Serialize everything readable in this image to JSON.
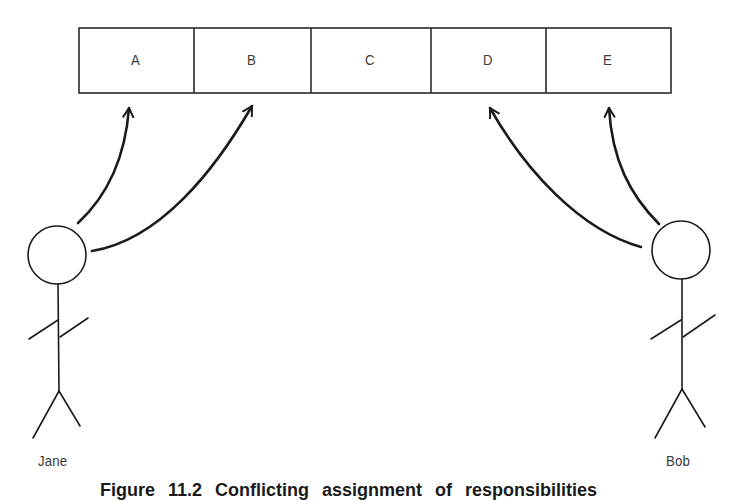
{
  "diagram": {
    "type": "stick-figure-responsibility-diagram",
    "boxes": [
      {
        "label": "A"
      },
      {
        "label": "B"
      },
      {
        "label": "C"
      },
      {
        "label": "D"
      },
      {
        "label": "E"
      }
    ],
    "actors": [
      {
        "name": "Jane",
        "points_to": [
          "A",
          "B"
        ]
      },
      {
        "name": "Bob",
        "points_to": [
          "D",
          "E"
        ]
      }
    ],
    "caption": "Figure 11.2  Conflicting assignment of responsibilities"
  },
  "colors": {
    "line": "#1a1a1a",
    "text": "#3a3a3a",
    "background": "#ffffff"
  }
}
